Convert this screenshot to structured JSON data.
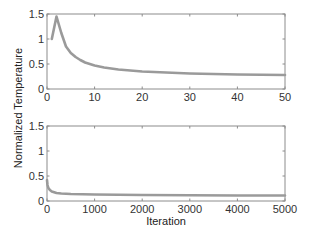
{
  "figure": {
    "ylabel": "Normalized Temperature",
    "xlabel": "Iteration",
    "line_color": "#9a9a9a",
    "axis_color": "#8c8c8c"
  },
  "chart_data": [
    {
      "type": "line",
      "title": "",
      "xlabel": "",
      "ylabel": "Normalized Temperature",
      "xlim": [
        0,
        50
      ],
      "ylim": [
        0,
        1.5
      ],
      "xticks": [
        0,
        10,
        20,
        30,
        40,
        50
      ],
      "yticks": [
        0,
        0.5,
        1,
        1.5
      ],
      "xtick_labels": [
        "0",
        "10",
        "20",
        "30",
        "40",
        "50"
      ],
      "ytick_labels": [
        "0",
        "0.5",
        "1",
        "1.5"
      ],
      "grid": false,
      "series": [
        {
          "name": "normalized temperature",
          "x": [
            1,
            2,
            3,
            4,
            5,
            6,
            7,
            8,
            10,
            12,
            15,
            20,
            25,
            30,
            35,
            40,
            45,
            50
          ],
          "y": [
            1.0,
            1.45,
            1.12,
            0.85,
            0.72,
            0.64,
            0.58,
            0.53,
            0.47,
            0.43,
            0.39,
            0.35,
            0.33,
            0.31,
            0.3,
            0.29,
            0.285,
            0.28
          ]
        }
      ]
    },
    {
      "type": "line",
      "title": "",
      "xlabel": "Iteration",
      "ylabel": "Normalized Temperature",
      "xlim": [
        0,
        5000
      ],
      "ylim": [
        0,
        1.5
      ],
      "xticks": [
        0,
        1000,
        2000,
        3000,
        4000,
        5000
      ],
      "yticks": [
        0,
        0.5,
        1,
        1.5
      ],
      "xtick_labels": [
        "0",
        "1000",
        "2000",
        "3000",
        "4000",
        "5000"
      ],
      "ytick_labels": [
        "0",
        "0.5",
        "1",
        "1.5"
      ],
      "grid": false,
      "series": [
        {
          "name": "normalized temperature",
          "x": [
            1,
            10,
            30,
            60,
            100,
            200,
            300,
            500,
            1000,
            1500,
            2000,
            3000,
            4000,
            5000
          ],
          "y": [
            0.42,
            0.32,
            0.26,
            0.22,
            0.19,
            0.16,
            0.15,
            0.14,
            0.13,
            0.125,
            0.12,
            0.115,
            0.11,
            0.11
          ]
        }
      ]
    }
  ]
}
